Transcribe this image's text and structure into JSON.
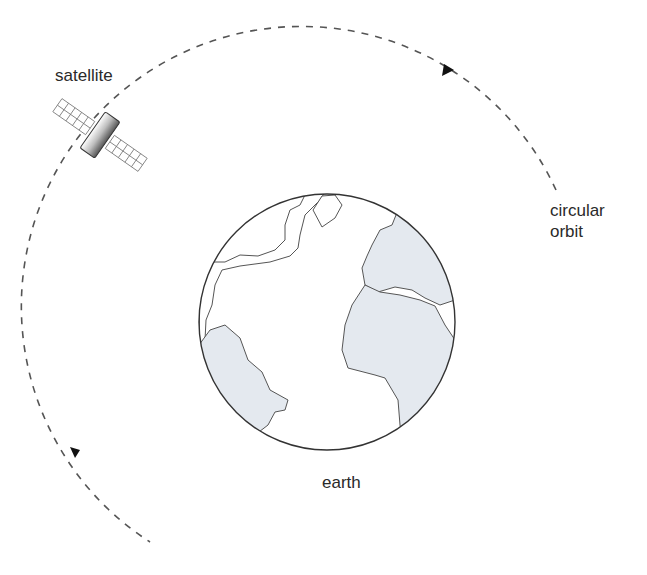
{
  "diagram": {
    "labels": {
      "satellite": "satellite",
      "orbit_line1": "circular",
      "orbit_line2": "orbit",
      "earth": "earth"
    },
    "colors": {
      "orbit_stroke": "#555555",
      "earth_outline": "#444444",
      "land_fill": "#e4e9ef",
      "text": "#2a2a2a"
    },
    "orbit": {
      "center_x": 318,
      "center_y": 318,
      "radius": 280,
      "direction": "counterclockwise"
    },
    "earth": {
      "center_x": 327,
      "center_y": 322,
      "radius": 128
    }
  }
}
